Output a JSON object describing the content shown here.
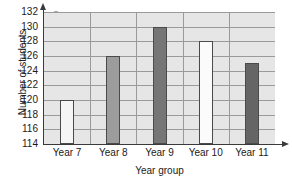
{
  "chart_data": {
    "type": "bar",
    "title": "",
    "subtitle": "",
    "xlabel": "Year group",
    "ylabel": "Number of students",
    "categories": [
      "Year 7",
      "Year 8",
      "Year 9",
      "Year 10",
      "Year 11"
    ],
    "values": [
      120,
      126,
      130,
      128,
      125
    ],
    "bar_colors": [
      "#f5f5f5",
      "#9c9c9c",
      "#767676",
      "#fbfbfb",
      "#656565"
    ],
    "ylim": [
      114,
      132
    ],
    "ytick_step": 2,
    "yticks": [
      114,
      116,
      118,
      120,
      122,
      124,
      126,
      128,
      130,
      132
    ],
    "ytick_labels": [
      "114",
      "116",
      "118",
      "120",
      "122",
      "124",
      "126",
      "128",
      "130",
      "132"
    ],
    "grid": true,
    "grid_orientation": "both",
    "legend": false,
    "legend_position": "none",
    "plot_background": "#e6e6e6",
    "gridline_color": "#9a9a9a",
    "axis_color": "#3a3a3a",
    "bar_border_color": "#4a4a4a"
  }
}
